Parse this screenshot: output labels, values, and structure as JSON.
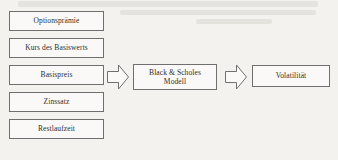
{
  "diagram": {
    "line_color": "#6f6f6f",
    "box_fill": "#faf9f7",
    "text_color": "#2d2d2d",
    "background_color": "#f3f2ef",
    "inputs": [
      {
        "label": "Optionsprämie"
      },
      {
        "label": "Kurs des Basiswerts"
      },
      {
        "label": "Basispreis"
      },
      {
        "label": "Zinssatz"
      },
      {
        "label": "Restlaufzeit"
      }
    ],
    "model": {
      "line1": "Black & Scholes",
      "line2": "Modell"
    },
    "output": {
      "label": "Volatilität"
    },
    "arrows": [
      {
        "name": "arrow-inputs-to-model",
        "direction": "right"
      },
      {
        "name": "arrow-model-to-output",
        "direction": "right"
      }
    ]
  }
}
